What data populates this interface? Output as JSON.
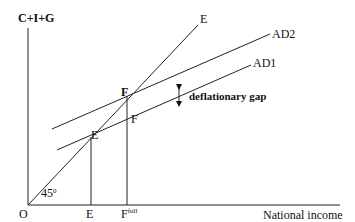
{
  "diagram": {
    "y_axis_label": "C+I+G",
    "x_axis_label": "National income",
    "origin_label": "O",
    "angle_label": "45",
    "angle_superscript": "0",
    "line_45_label": "E",
    "ad2_label": "AD2",
    "ad1_label": "AD1",
    "equilibrium_point_label": "E",
    "full_employment_point_upper_label": "F",
    "full_employment_point_lower_label": "F",
    "gap_label": "deflationary gap",
    "x_tick_e": "E",
    "x_tick_f": "F",
    "x_tick_f_superscript": "full"
  },
  "colors": {
    "line": "#222222",
    "text": "#111111",
    "background": "#ffffff"
  }
}
